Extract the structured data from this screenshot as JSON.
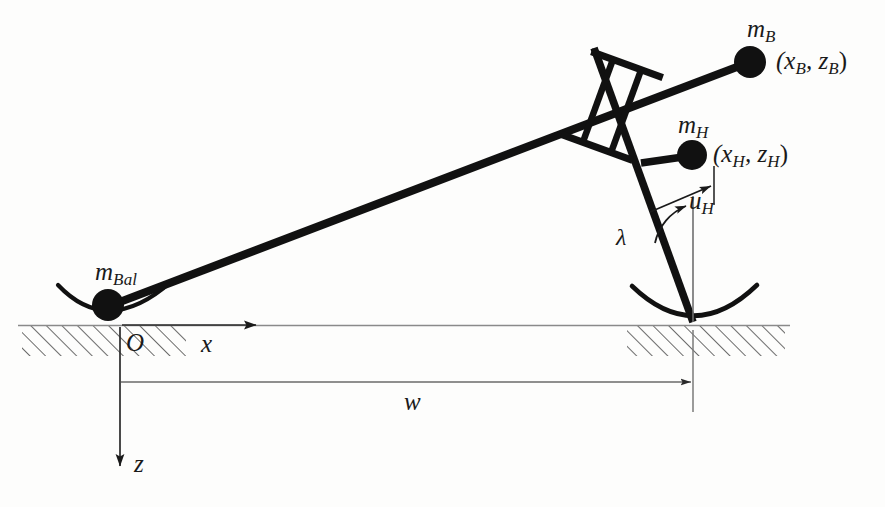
{
  "figure": {
    "type": "mechanism-diagram",
    "background_color": "#fdfdfc",
    "stroke_color": "#111111",
    "thin_stroke_color": "#7a7a7a"
  },
  "labels": {
    "mass_beam": {
      "text": "m",
      "sub": "B"
    },
    "mass_beam_coords": {
      "text": "(x",
      "sub1": "B",
      "mid": ", z",
      "sub2": "B",
      "close": ")"
    },
    "mass_hand": {
      "text": "m",
      "sub": "H"
    },
    "mass_hand_coords": {
      "text": "(x",
      "sub1": "H",
      "mid": ", z",
      "sub2": "H",
      "close": ")"
    },
    "mass_balance": {
      "text": "m",
      "sub": "Bal"
    },
    "input_hand": {
      "text": "u",
      "sub": "H"
    },
    "angle_lambda": {
      "text": "λ"
    },
    "origin": {
      "text": "O"
    },
    "axis_x": {
      "text": "x"
    },
    "axis_z": {
      "text": "z"
    },
    "width_w": {
      "text": "w"
    }
  },
  "geometry": {
    "ground_line_y": 325,
    "origin": {
      "x": 120,
      "y": 325
    },
    "mass_balance_center": {
      "x": 108,
      "y": 305
    },
    "joint_center": {
      "x": 612,
      "y": 106
    },
    "mass_beam_center": {
      "x": 750,
      "y": 62
    },
    "mass_hand_center": {
      "x": 692,
      "y": 155
    },
    "leg_ground_pivot": {
      "x": 693,
      "y": 322
    },
    "width_dimension": {
      "from_x": 120,
      "to_x": 693,
      "y": 382
    },
    "x_axis_arrow_end": {
      "x": 258,
      "y": 325
    },
    "z_axis_arrow_end": {
      "x": 120,
      "y": 468
    }
  },
  "elements": [
    {
      "name": "main-beam",
      "description": "inclined rigid beam from balance mass to beam mass"
    },
    {
      "name": "prismatic-joint",
      "description": "slider joint with two crossbars and parallel rails"
    },
    {
      "name": "leg-link",
      "description": "near-vertical leg tilted by lambda"
    },
    {
      "name": "hand-arm",
      "description": "short horizontal arm carrying mass m_H"
    },
    {
      "name": "left-rocker",
      "description": "curved rocker contact under m_Bal"
    },
    {
      "name": "right-rocker",
      "description": "curved rocker contact at leg ground pivot"
    },
    {
      "name": "ground-hatching",
      "description": "diagonal hatch fill representing ground"
    }
  ]
}
